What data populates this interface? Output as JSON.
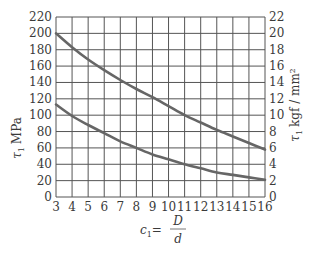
{
  "chart_data": {
    "type": "line",
    "title": "",
    "xlabel": "c1 = D/d",
    "xlabel_parts": {
      "lhs": "c",
      "sub": "1",
      "eq": "=",
      "num": "D",
      "den": "d"
    },
    "ylabel": "τ1 MPa",
    "ylabel_parts": {
      "sym": "τ",
      "sub": "1",
      "unit": "MPa"
    },
    "y2label": "τ1 kgf / mm²",
    "y2label_parts": {
      "sym": "τ",
      "sub": "1",
      "unit": "kgf / mm²"
    },
    "xlim": [
      3,
      16
    ],
    "ylim": [
      0,
      220
    ],
    "y2lim": [
      0,
      22
    ],
    "x_ticks": [
      3,
      4,
      5,
      6,
      7,
      8,
      9,
      10,
      11,
      12,
      13,
      14,
      15,
      16
    ],
    "y_ticks": [
      0,
      20,
      40,
      60,
      80,
      100,
      120,
      140,
      160,
      180,
      200,
      220
    ],
    "y2_ticks": [
      0,
      2,
      4,
      6,
      8,
      10,
      12,
      14,
      16,
      18,
      20,
      22
    ],
    "grid": true,
    "legend": null,
    "x": [
      3,
      4,
      5,
      6,
      7,
      8,
      9,
      10,
      11,
      12,
      13,
      14,
      15,
      16
    ],
    "series": [
      {
        "name": "upper curve",
        "values": [
          200,
          183,
          168,
          155,
          143,
          132,
          122,
          111,
          100,
          91,
          82,
          74,
          66,
          58
        ]
      },
      {
        "name": "lower curve",
        "values": [
          113,
          99,
          88,
          78,
          68,
          60,
          52,
          46,
          40,
          35,
          30,
          27,
          24,
          21
        ]
      }
    ],
    "colors": {
      "grid": "#555555",
      "line": "#666666",
      "text": "#3a3a3a"
    }
  }
}
